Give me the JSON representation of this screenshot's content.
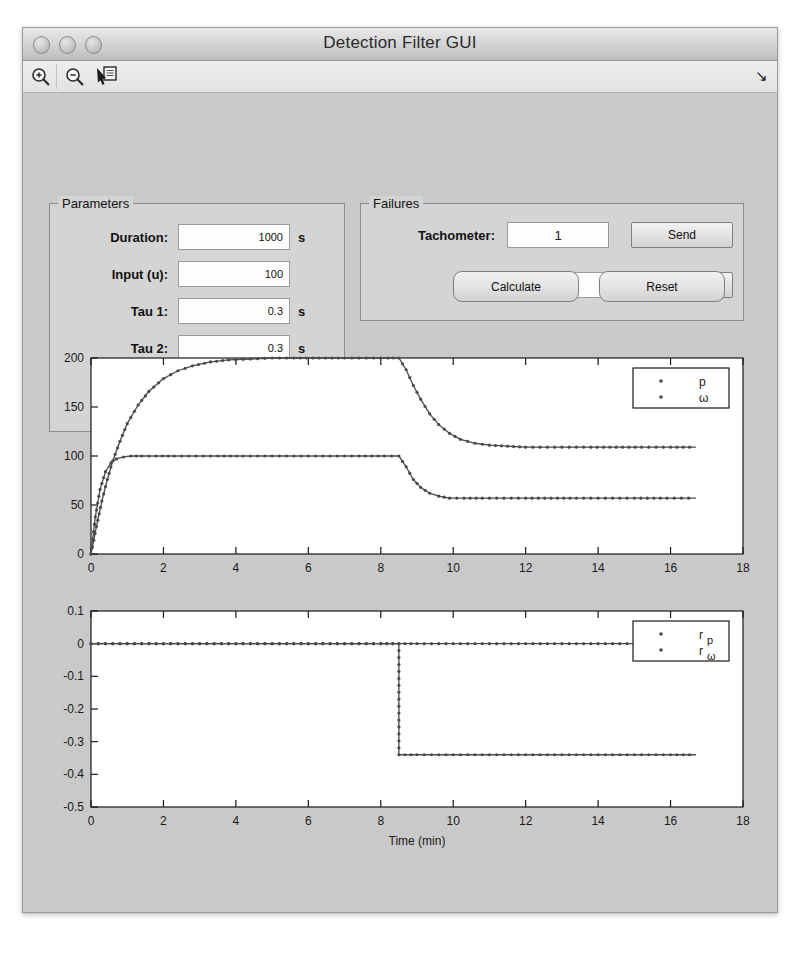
{
  "window": {
    "title": "Detection Filter GUI",
    "traffic_lights": [
      "close-button",
      "minimize-button",
      "zoom-button"
    ]
  },
  "toolbar": {
    "items": [
      {
        "name": "zoom-in-icon",
        "label": "Zoom In"
      },
      {
        "name": "zoom-out-icon",
        "label": "Zoom Out"
      },
      {
        "name": "data-cursor-icon",
        "label": "Data Cursor"
      }
    ],
    "corner_arrow": "↘"
  },
  "parameters": {
    "title": "Parameters",
    "fields": [
      {
        "label": "Duration:",
        "value": "1000",
        "unit": "s"
      },
      {
        "label": "Input (u):",
        "value": "100",
        "unit": ""
      },
      {
        "label": "Tau 1:",
        "value": "0.3",
        "unit": "s"
      },
      {
        "label": "Tau 2:",
        "value": "0.3",
        "unit": "s"
      }
    ],
    "gains_label": "Gains (D):",
    "gains": [
      [
        "1.38",
        "0"
      ],
      [
        "0.00693",
        "1.39"
      ]
    ]
  },
  "failures": {
    "title": "Failures",
    "rows": [
      {
        "label": "Tachometer:",
        "value": "1",
        "button": "Send"
      },
      {
        "label": "Input:",
        "value": "0.5",
        "button": "Send"
      }
    ]
  },
  "actions": {
    "calculate": "Calculate",
    "reset": "Reset"
  },
  "chart_data": [
    {
      "id": "states-plot",
      "type": "line",
      "title": "",
      "xlabel": "",
      "ylabel": "",
      "xlim": [
        0,
        18
      ],
      "ylim": [
        0,
        200
      ],
      "xticks": [
        0,
        2,
        4,
        6,
        8,
        10,
        12,
        14,
        16,
        18
      ],
      "yticks": [
        0,
        50,
        100,
        150,
        200
      ],
      "grid": false,
      "legend_position": "top-right",
      "markers": "dot",
      "fault_time": 8.5,
      "t_end": 16.7,
      "series": [
        {
          "name": "p",
          "color": "#4a4a4a",
          "x": [
            0,
            0.15,
            0.3,
            0.45,
            0.6,
            0.8,
            1.0,
            1.3,
            1.6,
            2.0,
            2.4,
            2.8,
            3.3,
            3.8,
            4.4,
            5.0,
            5.6,
            6.3,
            7.0,
            7.6,
            8.2,
            8.5,
            8.7,
            8.9,
            9.1,
            9.35,
            9.6,
            9.9,
            10.2,
            10.6,
            11.0,
            11.5,
            12.0,
            12.6,
            13.2,
            13.8,
            14.5,
            15.2,
            16.0,
            16.7
          ],
          "y": [
            0,
            28,
            54,
            76,
            95,
            115,
            133,
            152,
            166,
            179,
            187,
            192,
            196,
            198,
            199,
            200,
            200,
            200,
            200,
            200,
            200,
            200,
            188,
            172,
            158,
            143,
            132,
            123,
            117,
            113,
            111,
            110,
            109,
            109,
            109,
            109,
            109,
            109,
            109,
            109
          ]
        },
        {
          "name": "ω",
          "color": "#4a4a4a",
          "x": [
            0,
            0.12,
            0.25,
            0.4,
            0.55,
            0.7,
            0.9,
            1.1,
            1.4,
            1.8,
            2.3,
            2.9,
            3.5,
            4.2,
            5.0,
            5.8,
            6.6,
            7.4,
            8.1,
            8.5,
            8.7,
            8.9,
            9.1,
            9.35,
            9.6,
            9.9,
            10.3,
            10.8,
            11.4,
            12.0,
            12.7,
            13.4,
            14.2,
            15.0,
            15.9,
            16.7
          ],
          "y": [
            0,
            38,
            66,
            84,
            93,
            97,
            99,
            100,
            100,
            100,
            100,
            100,
            100,
            100,
            100,
            100,
            100,
            100,
            100,
            100,
            89,
            76,
            68,
            62,
            59,
            57,
            57,
            57,
            57,
            57,
            57,
            57,
            57,
            57,
            57,
            57
          ]
        }
      ]
    },
    {
      "id": "residuals-plot",
      "type": "line",
      "title": "",
      "xlabel": "Time (min)",
      "ylabel": "",
      "xlim": [
        0,
        18
      ],
      "ylim": [
        -0.5,
        0.1
      ],
      "xticks": [
        0,
        2,
        4,
        6,
        8,
        10,
        12,
        14,
        16,
        18
      ],
      "yticks": [
        0.1,
        0,
        -0.1,
        -0.2,
        -0.3,
        -0.4,
        -0.5
      ],
      "grid": false,
      "legend_position": "top-right",
      "markers": "dot",
      "fault_time": 8.5,
      "t_end": 16.7,
      "series": [
        {
          "name": "r_p",
          "color": "#4a4a4a",
          "x": [
            0,
            1,
            2,
            3,
            4,
            5,
            6,
            7,
            8,
            8.5,
            9,
            10,
            11,
            12,
            13,
            14,
            15,
            16,
            16.7
          ],
          "y": [
            0,
            0,
            0,
            0,
            0,
            0,
            0,
            0,
            0,
            0,
            0,
            0,
            0,
            0,
            0,
            0,
            0,
            0,
            0
          ]
        },
        {
          "name": "r_ω",
          "color": "#4a4a4a",
          "x": [
            0,
            1,
            2,
            3,
            4,
            5,
            6,
            7,
            8,
            8.5,
            8.5,
            9,
            10,
            11,
            12,
            13,
            14,
            15,
            16,
            16.7
          ],
          "y": [
            0,
            0,
            0,
            0,
            0,
            0,
            0,
            0,
            0,
            0,
            -0.34,
            -0.34,
            -0.34,
            -0.34,
            -0.34,
            -0.34,
            -0.34,
            -0.34,
            -0.34,
            -0.34
          ]
        }
      ]
    }
  ]
}
